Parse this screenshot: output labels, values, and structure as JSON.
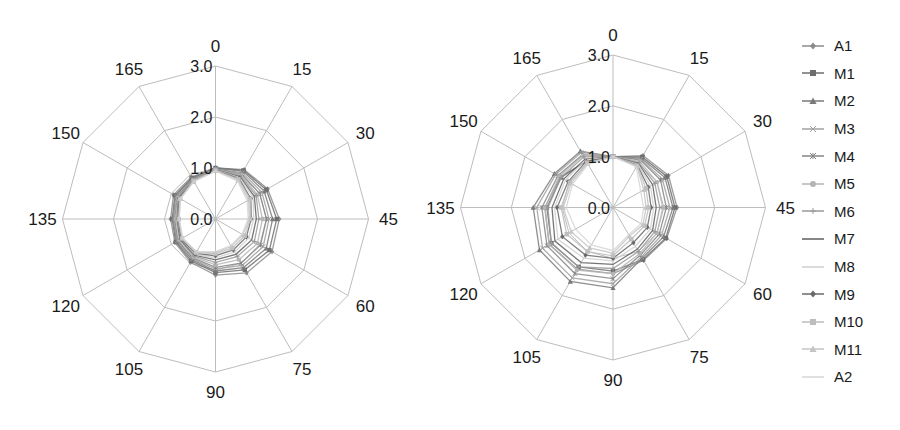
{
  "chart_data": [
    {
      "type": "radar",
      "panel": "left",
      "title": "",
      "angle_labels": [
        "0",
        "15",
        "30",
        "45",
        "60",
        "75",
        "90",
        "105",
        "120",
        "135",
        "150",
        "165"
      ],
      "radial_ticks": [
        "0.0",
        "1.0",
        "2.0",
        "3.0"
      ],
      "rlim": [
        0,
        3.0
      ],
      "grid": true,
      "series": [
        {
          "name": "A1",
          "values": [
            1.0,
            1.12,
            1.18,
            1.25,
            1.28,
            1.22,
            1.1,
            0.98,
            0.92,
            0.88,
            0.95,
            0.95
          ]
        },
        {
          "name": "M1",
          "values": [
            1.0,
            1.1,
            1.15,
            1.2,
            1.22,
            1.15,
            1.05,
            0.95,
            0.9,
            0.85,
            0.92,
            0.93
          ]
        },
        {
          "name": "M2",
          "values": [
            1.0,
            1.08,
            1.1,
            1.12,
            1.15,
            1.1,
            1.02,
            0.92,
            0.88,
            0.83,
            0.9,
            0.92
          ]
        },
        {
          "name": "M3",
          "values": [
            0.98,
            1.05,
            1.05,
            1.05,
            1.08,
            1.05,
            0.98,
            0.9,
            0.86,
            0.82,
            0.88,
            0.9
          ]
        },
        {
          "name": "M4",
          "values": [
            0.98,
            1.02,
            1.0,
            1.0,
            1.02,
            1.0,
            0.95,
            0.88,
            0.85,
            0.8,
            0.86,
            0.9
          ]
        },
        {
          "name": "M5",
          "values": [
            0.97,
            1.0,
            0.95,
            0.92,
            0.95,
            0.92,
            0.9,
            0.86,
            0.82,
            0.78,
            0.85,
            0.88
          ]
        },
        {
          "name": "M6",
          "values": [
            0.97,
            0.98,
            0.92,
            0.85,
            0.88,
            0.85,
            0.85,
            0.84,
            0.8,
            0.76,
            0.84,
            0.88
          ]
        },
        {
          "name": "M7",
          "values": [
            0.96,
            0.96,
            0.88,
            0.8,
            0.82,
            0.8,
            0.8,
            0.82,
            0.8,
            0.75,
            0.83,
            0.87
          ]
        },
        {
          "name": "M8",
          "values": [
            0.96,
            0.94,
            0.85,
            0.75,
            0.75,
            0.75,
            0.76,
            0.8,
            0.78,
            0.74,
            0.82,
            0.87
          ]
        },
        {
          "name": "M9",
          "values": [
            0.95,
            0.92,
            0.8,
            0.7,
            0.7,
            0.7,
            0.72,
            0.78,
            0.78,
            0.73,
            0.82,
            0.86
          ]
        },
        {
          "name": "M10",
          "values": [
            0.95,
            0.9,
            0.78,
            0.68,
            0.66,
            0.66,
            0.68,
            0.76,
            0.76,
            0.72,
            0.8,
            0.86
          ]
        },
        {
          "name": "M11",
          "values": [
            0.95,
            0.88,
            0.75,
            0.66,
            0.62,
            0.62,
            0.66,
            0.75,
            0.75,
            0.72,
            0.8,
            0.85
          ]
        },
        {
          "name": "A2",
          "values": [
            0.94,
            0.86,
            0.72,
            0.64,
            0.6,
            0.6,
            0.64,
            0.74,
            0.74,
            0.71,
            0.79,
            0.85
          ]
        }
      ]
    },
    {
      "type": "radar",
      "panel": "right",
      "title": "",
      "angle_labels": [
        "0",
        "15",
        "30",
        "45",
        "60",
        "75",
        "90",
        "105",
        "120",
        "135",
        "150",
        "165"
      ],
      "radial_ticks": [
        "0.0",
        "1.0",
        "2.0",
        "3.0"
      ],
      "rlim": [
        0,
        3.0
      ],
      "grid": true,
      "series": [
        {
          "name": "A1",
          "values": [
            1.0,
            1.18,
            1.26,
            1.26,
            1.22,
            1.2,
            1.3,
            1.4,
            1.45,
            1.34,
            1.2,
            1.05
          ]
        },
        {
          "name": "M1",
          "values": [
            1.0,
            1.15,
            1.22,
            1.22,
            1.2,
            1.18,
            1.25,
            1.35,
            1.4,
            1.3,
            1.18,
            1.05
          ]
        },
        {
          "name": "M2",
          "values": [
            1.0,
            1.12,
            1.18,
            1.18,
            1.15,
            1.15,
            1.58,
            1.68,
            1.67,
            1.57,
            1.33,
            1.28
          ]
        },
        {
          "name": "M3",
          "values": [
            1.0,
            1.1,
            1.12,
            1.12,
            1.1,
            1.12,
            1.5,
            1.6,
            1.6,
            1.5,
            1.3,
            1.25
          ]
        },
        {
          "name": "M4",
          "values": [
            1.0,
            1.08,
            1.08,
            1.05,
            1.05,
            1.08,
            1.4,
            1.5,
            1.5,
            1.4,
            1.25,
            1.2
          ]
        },
        {
          "name": "M5",
          "values": [
            1.0,
            1.05,
            1.0,
            0.98,
            1.0,
            1.05,
            1.3,
            1.42,
            1.45,
            1.34,
            1.22,
            1.18
          ]
        },
        {
          "name": "M6",
          "values": [
            1.0,
            1.02,
            0.95,
            0.92,
            0.95,
            1.0,
            1.2,
            1.35,
            1.4,
            1.28,
            1.18,
            1.15
          ]
        },
        {
          "name": "M7",
          "values": [
            1.0,
            1.0,
            0.9,
            0.85,
            0.9,
            0.95,
            1.12,
            1.25,
            1.32,
            1.2,
            1.12,
            1.1
          ]
        },
        {
          "name": "M8",
          "values": [
            1.0,
            0.98,
            0.85,
            0.8,
            0.85,
            0.88,
            1.05,
            1.15,
            1.25,
            1.15,
            1.08,
            1.08
          ]
        },
        {
          "name": "M9",
          "values": [
            1.0,
            0.96,
            0.8,
            0.75,
            0.78,
            0.8,
            1.0,
            1.08,
            1.15,
            1.1,
            1.02,
            1.05
          ]
        },
        {
          "name": "M10",
          "values": [
            1.0,
            0.95,
            0.75,
            0.7,
            0.72,
            0.72,
            0.95,
            1.0,
            1.05,
            1.02,
            0.98,
            1.02
          ]
        },
        {
          "name": "M11",
          "values": [
            1.0,
            0.94,
            0.7,
            0.65,
            0.68,
            0.65,
            0.9,
            0.92,
            0.95,
            0.98,
            0.95,
            1.0
          ]
        },
        {
          "name": "A2",
          "values": [
            1.0,
            0.92,
            0.63,
            0.6,
            0.64,
            0.62,
            0.85,
            0.85,
            0.85,
            0.92,
            0.92,
            0.98
          ]
        }
      ]
    }
  ],
  "legend": {
    "items": [
      {
        "label": "A1",
        "color": "#8c8c8c",
        "marker": "diamond"
      },
      {
        "label": "M1",
        "color": "#6e6e6e",
        "marker": "square"
      },
      {
        "label": "M2",
        "color": "#7a7a7a",
        "marker": "triangle"
      },
      {
        "label": "M3",
        "color": "#a0a0a0",
        "marker": "x"
      },
      {
        "label": "M4",
        "color": "#858585",
        "marker": "star"
      },
      {
        "label": "M5",
        "color": "#b4b4b4",
        "marker": "circle"
      },
      {
        "label": "M6",
        "color": "#9a9a9a",
        "marker": "plus"
      },
      {
        "label": "M7",
        "color": "#5e5e5e",
        "marker": "none"
      },
      {
        "label": "M8",
        "color": "#cfcfcf",
        "marker": "none"
      },
      {
        "label": "M9",
        "color": "#6a6a6a",
        "marker": "diamond"
      },
      {
        "label": "M10",
        "color": "#bdbdbd",
        "marker": "square"
      },
      {
        "label": "M11",
        "color": "#c4c4c4",
        "marker": "triangle"
      },
      {
        "label": "A2",
        "color": "#d6d6d6",
        "marker": "none"
      }
    ]
  },
  "colors": {
    "grid": "#bdbdbd",
    "text": "#1a1a1a",
    "background": "#ffffff"
  }
}
